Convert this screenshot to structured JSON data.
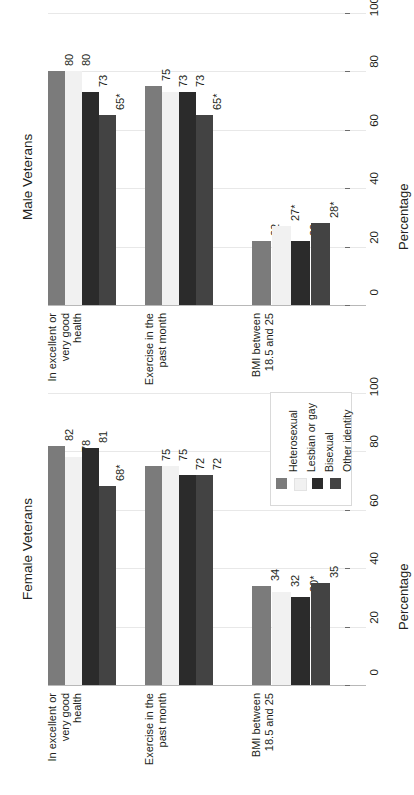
{
  "chart_data": {
    "type": "bar",
    "orientation": "rotated-90",
    "title": "",
    "xlabel": "",
    "ylabel": "Percentage",
    "ylim": [
      0,
      100
    ],
    "yticks": [
      0,
      20,
      40,
      60,
      80,
      100
    ],
    "ytick_labels": [
      "0",
      "20",
      "40",
      "60",
      "80",
      "100"
    ],
    "grid": true,
    "legend_position": "top-right-of-lower-panel",
    "series_names": [
      "Heterosexual",
      "Lesbian or gay",
      "Bisexual",
      "Other identity"
    ],
    "series_colors": [
      "#7b7b7b",
      "#f1f1f1",
      "#2b2b2b",
      "#434343"
    ],
    "categories": [
      "In excellent or very good health",
      "Exercise in the past month",
      "BMI between 18.5 and 25"
    ],
    "category_lines": [
      [
        "In excellent or",
        "very good",
        "health"
      ],
      [
        "Exercise in the",
        "past month"
      ],
      [
        "BMI between",
        "18.5 and 25"
      ]
    ],
    "panels": [
      {
        "title": "Male Veterans",
        "series": [
          {
            "name": "Heterosexual",
            "values": [
              80,
              75,
              22
            ],
            "labels": [
              "80",
              "75",
              "22"
            ]
          },
          {
            "name": "Lesbian or gay",
            "values": [
              80,
              73,
              27
            ],
            "labels": [
              "80",
              "73",
              "27*"
            ]
          },
          {
            "name": "Bisexual",
            "values": [
              73,
              73,
              22
            ],
            "labels": [
              "73",
              "73",
              "22"
            ]
          },
          {
            "name": "Other identity",
            "values": [
              65,
              65,
              28
            ],
            "labels": [
              "65*",
              "65*",
              "28*"
            ]
          }
        ]
      },
      {
        "title": "Female Veterans",
        "series": [
          {
            "name": "Heterosexual",
            "values": [
              82,
              75,
              34
            ],
            "labels": [
              "82",
              "75",
              "34"
            ]
          },
          {
            "name": "Lesbian or gay",
            "values": [
              78,
              75,
              32
            ],
            "labels": [
              "78",
              "75",
              "32"
            ]
          },
          {
            "name": "Bisexual",
            "values": [
              81,
              72,
              30
            ],
            "labels": [
              "81",
              "72",
              "30*"
            ]
          },
          {
            "name": "Other identity",
            "values": [
              68,
              72,
              35
            ],
            "labels": [
              "68*",
              "72",
              "35"
            ]
          }
        ]
      }
    ],
    "footnote_marker": "*"
  },
  "legend": {
    "items": [
      {
        "label": "Heterosexual",
        "color": "#7b7b7b"
      },
      {
        "label": "Lesbian or gay",
        "color": "#f1f1f1"
      },
      {
        "label": "Bisexual",
        "color": "#2b2b2b"
      },
      {
        "label": "Other identity",
        "color": "#434343"
      }
    ]
  },
  "axis": {
    "percentage_label": "Percentage",
    "tick_labels": [
      "0",
      "20",
      "40",
      "60",
      "80",
      "100"
    ]
  },
  "panel_titles": {
    "male": "Male Veterans",
    "female": "Female Veterans"
  }
}
